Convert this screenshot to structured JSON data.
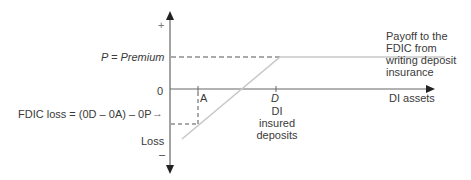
{
  "diagram": {
    "axes": {
      "y_plus": "+",
      "y_minus": "–",
      "origin": "0",
      "x_label": "DI assets",
      "loss_label": "Loss"
    },
    "premium_label": "P = Premium",
    "tick_a": "A",
    "tick_d": "D",
    "tick_d_caption_lines": [
      "DI",
      "insured",
      "deposits"
    ],
    "payoff_label_lines": [
      "Payoff to the",
      "FDIC from",
      "writing deposit",
      "insurance"
    ],
    "fdic_loss_label": "FDIC loss = (0D – 0A) – 0P",
    "fdic_loss_arrow": "→",
    "colors": {
      "axis": "#555555",
      "payoff_line": "#c8c8c8",
      "dashed": "#555555",
      "text": "#3a3a3a"
    }
  }
}
